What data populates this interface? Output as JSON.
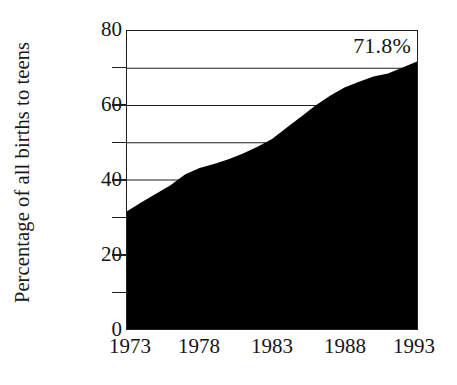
{
  "chart_data": {
    "type": "area",
    "title": "",
    "subtitle": "",
    "xlabel": "",
    "ylabel": "Percentage of all births to teens",
    "xlim": [
      1973,
      1993
    ],
    "ylim": [
      0,
      80
    ],
    "grid": true,
    "legend_position": "none",
    "fill_color": "#000000",
    "axis_color": "#1f1f1f",
    "background_color": "#ffffff",
    "x_tick_labels": [
      "1973",
      "1978",
      "1983",
      "1988",
      "1993"
    ],
    "x_tick_values": [
      1973,
      1978,
      1983,
      1988,
      1993
    ],
    "y_tick_labels": [
      "0",
      "20",
      "40",
      "60",
      "80"
    ],
    "y_tick_values": [
      0,
      20,
      40,
      60,
      80
    ],
    "y_minor_tick_values": [
      10,
      30,
      50,
      70
    ],
    "gridline_values": [
      40,
      50,
      60,
      70
    ],
    "annotations": [
      {
        "text": "71.8%",
        "x": 1993,
        "y": 78,
        "position": "top-right"
      }
    ],
    "x": [
      1973,
      1974,
      1975,
      1976,
      1977,
      1978,
      1979,
      1980,
      1981,
      1982,
      1983,
      1984,
      1985,
      1986,
      1987,
      1988,
      1989,
      1990,
      1991,
      1992,
      1993
    ],
    "values": [
      31.6,
      34.0,
      36.3,
      38.6,
      41.5,
      43.2,
      44.3,
      45.6,
      47.1,
      48.9,
      51.0,
      54.0,
      57.0,
      60.0,
      62.6,
      64.8,
      66.4,
      67.8,
      68.6,
      70.2,
      71.8
    ],
    "series": [
      {
        "name": "Percentage of all births to teens",
        "values": [
          31.6,
          34.0,
          36.3,
          38.6,
          41.5,
          43.2,
          44.3,
          45.6,
          47.1,
          48.9,
          51.0,
          54.0,
          57.0,
          60.0,
          62.6,
          64.8,
          66.4,
          67.8,
          68.6,
          70.2,
          71.8
        ]
      }
    ]
  },
  "axis": {
    "y_title": "Percentage of all births to teens",
    "annotation_value": "71.8%"
  }
}
